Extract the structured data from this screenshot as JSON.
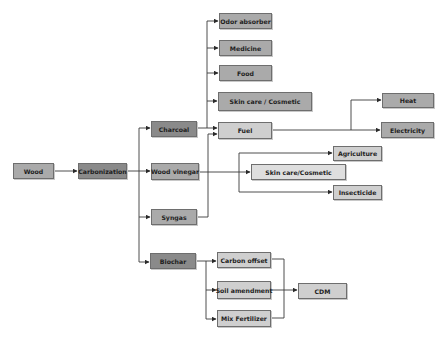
{
  "diagram": {
    "nodes": {
      "wood": "Wood",
      "carbonization": "Carbonization",
      "charcoal": "Charcoal",
      "wood_vinegar": "Wood vinegar",
      "syngas": "Syngas",
      "biochar": "Biochar",
      "odor_absorber": "Odor absorber",
      "medicine": "Medicine",
      "food": "Food",
      "skin_care_cosmetic": "Skin care / Cosmetic",
      "fuel": "Fuel",
      "heat": "Heat",
      "electricity": "Electricity",
      "agriculture": "Agriculture",
      "skin_care_cosmetic_2": "Skin care/Cosmetic",
      "insecticide": "Insecticide",
      "carbon_offset": "Carbon offset",
      "soil_amendment": "Soil amendment",
      "mix_fertilizer": "Mix Fertilizer",
      "cdm": "CDM"
    },
    "edges": [
      [
        "Wood",
        "Carbonization"
      ],
      [
        "Carbonization",
        "Charcoal"
      ],
      [
        "Carbonization",
        "Wood vinegar"
      ],
      [
        "Carbonization",
        "Syngas"
      ],
      [
        "Carbonization",
        "Biochar"
      ],
      [
        "Charcoal",
        "Odor absorber"
      ],
      [
        "Charcoal",
        "Medicine"
      ],
      [
        "Charcoal",
        "Food"
      ],
      [
        "Charcoal",
        "Skin care / Cosmetic"
      ],
      [
        "Charcoal",
        "Fuel"
      ],
      [
        "Syngas",
        "Fuel"
      ],
      [
        "Fuel",
        "Heat"
      ],
      [
        "Fuel",
        "Electricity"
      ],
      [
        "Wood vinegar",
        "Agriculture"
      ],
      [
        "Wood vinegar",
        "Skin care/Cosmetic"
      ],
      [
        "Wood vinegar",
        "Insecticide"
      ],
      [
        "Biochar",
        "Carbon offset"
      ],
      [
        "Biochar",
        "Soil amendment"
      ],
      [
        "Biochar",
        "Mix Fertilizer"
      ],
      [
        "Carbon offset",
        "CDM"
      ],
      [
        "Soil amendment",
        "CDM"
      ],
      [
        "Mix Fertilizer",
        "CDM"
      ]
    ],
    "colors": {
      "dark_node": "#8a8a8a",
      "mid_node": "#aaaaaa",
      "light_node": "#cfcfcf",
      "lighter_node": "#dedede",
      "line": "#3a3a3a"
    }
  }
}
